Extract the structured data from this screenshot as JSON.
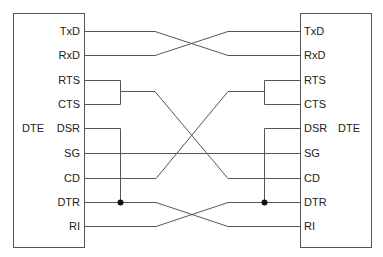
{
  "diagram": {
    "type": "null-modem wiring diagram",
    "line_color": "#555555",
    "left_device": {
      "label": "DTE",
      "pins": [
        "TxD",
        "RxD",
        "RTS",
        "CTS",
        "DSR",
        "SG",
        "CD",
        "DTR",
        "RI"
      ]
    },
    "right_device": {
      "label": "DTE",
      "pins": [
        "TxD",
        "RxD",
        "RTS",
        "CTS",
        "DSR",
        "SG",
        "CD",
        "DTR",
        "RI"
      ]
    },
    "connections": [
      {
        "from": "TxD",
        "to": "RxD"
      },
      {
        "from": "RxD",
        "to": "TxD"
      },
      {
        "from": "RTS+CTS",
        "to": "CD"
      },
      {
        "from": "CD",
        "to": "RTS+CTS"
      },
      {
        "from": "SG",
        "to": "SG"
      },
      {
        "from": "DTR",
        "to": "RI"
      },
      {
        "from": "RI",
        "to": "DTR"
      },
      {
        "from": "DSR",
        "to": "DTR (local junction)"
      }
    ]
  }
}
